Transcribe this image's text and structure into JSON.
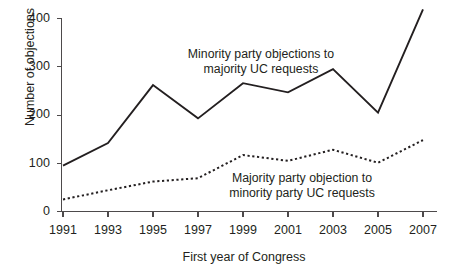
{
  "chart_data": {
    "type": "line",
    "title": "",
    "subtitle": "",
    "xlabel": "First year of Congress",
    "ylabel": "Number of objections",
    "x": [
      1991,
      1993,
      1995,
      1997,
      1999,
      2001,
      2003,
      2005,
      2007
    ],
    "categories": [
      "1991",
      "1993",
      "1995",
      "1997",
      "1999",
      "2001",
      "2003",
      "2005",
      "2007"
    ],
    "xtick_labels": [
      "1991",
      "1993",
      "1995",
      "1997",
      "1999",
      "2001",
      "2003",
      "2005",
      "2007"
    ],
    "ytick_labels": [
      "0",
      "100",
      "200",
      "300",
      "400"
    ],
    "yticks": [
      0,
      100,
      200,
      300,
      400
    ],
    "ylim": [
      0,
      430
    ],
    "xlim": [
      1991,
      2007
    ],
    "grid": false,
    "legend_position": "inline-annotations",
    "series": [
      {
        "name": "Minority party objections to majority UC requests",
        "style": "solid",
        "color": "#231f20",
        "values": [
          95,
          142,
          262,
          193,
          266,
          247,
          295,
          205,
          419
        ]
      },
      {
        "name": "Majority party objection to minority party UC requests",
        "style": "dotted",
        "color": "#231f20",
        "values": [
          25,
          44,
          62,
          69,
          117,
          105,
          128,
          101,
          148
        ]
      }
    ],
    "annotations": [
      {
        "id": "minority",
        "line1": "Minority party objections to",
        "line2": "majority UC requests"
      },
      {
        "id": "majority",
        "line1": "Majority party objection to",
        "line2": "minority party UC requests"
      }
    ]
  },
  "axes": {
    "y_label": "Number of objections",
    "x_label": "First year of Congress",
    "y_ticks": [
      "400",
      "300",
      "200",
      "100",
      "0"
    ],
    "x_ticks": [
      "1991",
      "1993",
      "1995",
      "1997",
      "1999",
      "2001",
      "2003",
      "2005",
      "2007"
    ]
  },
  "annotations": {
    "minority_line1": "Minority party objections to",
    "minority_line2": "majority UC requests",
    "majority_line1": "Majority party objection to",
    "majority_line2": "minority party UC requests"
  },
  "colors": {
    "ink": "#231f20",
    "axis": "#4d4a4b",
    "background": "#ffffff"
  }
}
